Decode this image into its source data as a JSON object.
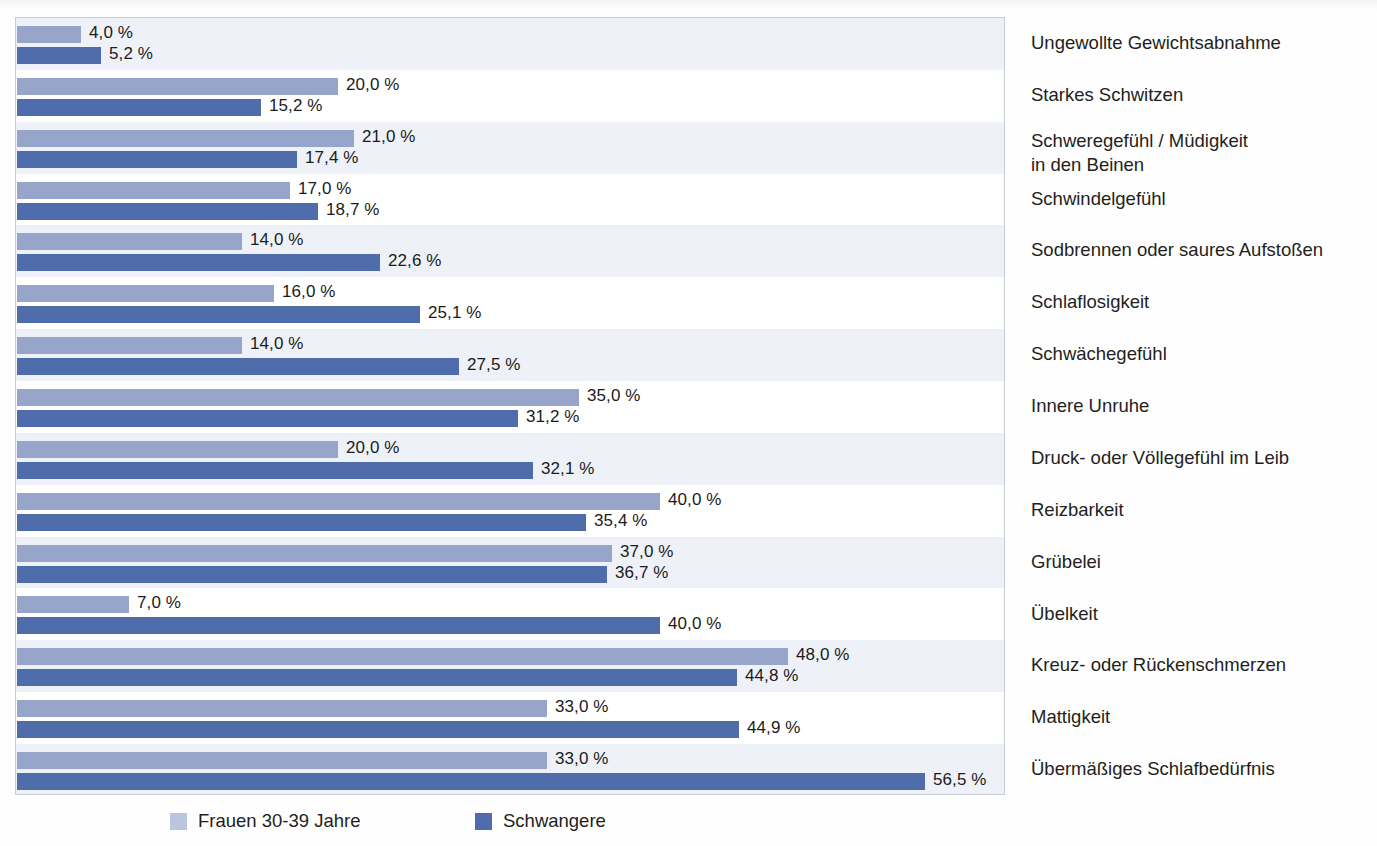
{
  "chart_data": {
    "type": "bar",
    "orientation": "horizontal",
    "title": "",
    "xlabel": "",
    "ylabel": "",
    "xlim": [
      0,
      61
    ],
    "grid": false,
    "value_suffix": " %",
    "decimal_separator": ",",
    "legend_position": "bottom",
    "categories": [
      "Ungewollte Gewichtsabnahme",
      "Starkes Schwitzen",
      "Schweregefühl / Müdigkeit\nin den Beinen",
      "Schwindelgefühl",
      "Sodbrennen oder saures Aufstoßen",
      "Schlaflosigkeit",
      "Schwächegefühl",
      "Innere Unruhe",
      "Druck- oder Völlegefühl im Leib",
      "Reizbarkeit",
      "Grübelei",
      "Übelkeit",
      "Kreuz- oder Rückenschmerzen",
      "Mattigkeit",
      "Übermäßiges Schlafbedürfnis"
    ],
    "series": [
      {
        "name": "Frauen 30-39 Jahre",
        "color": "#97a5ca",
        "values": [
          4.0,
          20.0,
          21.0,
          17.0,
          14.0,
          16.0,
          14.0,
          35.0,
          20.0,
          40.0,
          37.0,
          7.0,
          48.0,
          33.0,
          33.0
        ],
        "labels": [
          "4,0 %",
          "20,0 %",
          "21,0 %",
          "17,0 %",
          "14,0 %",
          "16,0 %",
          "14,0 %",
          "35,0 %",
          "20,0 %",
          "40,0 %",
          "37,0 %",
          "7,0 %",
          "48,0 %",
          "33,0 %",
          "33,0 %"
        ]
      },
      {
        "name": "Schwangere",
        "color": "#4f6cab",
        "values": [
          5.2,
          15.2,
          17.4,
          18.7,
          22.6,
          25.1,
          27.5,
          31.2,
          32.1,
          35.4,
          36.7,
          40.0,
          44.8,
          44.9,
          56.5
        ],
        "labels": [
          "5,2 %",
          "15,2 %",
          "17,4 %",
          "18,7 %",
          "22,6 %",
          "25,1 %",
          "27,5 %",
          "31,2 %",
          "32,1 %",
          "35,4 %",
          "36,7 %",
          "40,0 %",
          "44,8 %",
          "44,9 %",
          "56,5 %"
        ]
      }
    ]
  },
  "legend": {
    "items": [
      {
        "label": "Frauen 30-39 Jahre",
        "swatch": "light"
      },
      {
        "label": "Schwangere",
        "swatch": "dark"
      }
    ]
  },
  "colors": {
    "series_light": "#97a5ca",
    "series_dark": "#4f6cab",
    "band": "#eef1f7",
    "frame": "#c9ccd4",
    "text": "#231f20"
  }
}
